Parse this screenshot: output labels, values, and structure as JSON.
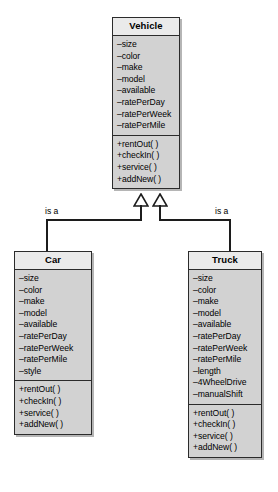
{
  "diagram": {
    "type": "uml-class-diagram",
    "background_color": "#ffffff",
    "box_fill_color": "#d2d2d2",
    "box_header_color": "#eaeaea",
    "line_color": "#1c1c1c"
  },
  "classes": {
    "vehicle": {
      "name": "Vehicle",
      "attributes": [
        "–size",
        "–color",
        "–make",
        "–model",
        "–available",
        "–ratePerDay",
        "–ratePerWeek",
        "–ratePerMile"
      ],
      "methods": [
        "+rentOut( )",
        "+checkIn( )",
        "+service( )",
        "+addNew( )"
      ]
    },
    "car": {
      "name": "Car",
      "attributes": [
        "–size",
        "–color",
        "–make",
        "–model",
        "–available",
        "–ratePerDay",
        "–ratePerWeek",
        "–ratePerMile",
        "–style"
      ],
      "methods": [
        "+rentOut( )",
        "+checkIn( )",
        "+service( )",
        "+addNew( )"
      ]
    },
    "truck": {
      "name": "Truck",
      "attributes": [
        "–size",
        "–color",
        "–make",
        "–model",
        "–available",
        "–ratePerDay",
        "–ratePerWeek",
        "–ratePerMile",
        "–length",
        "–4WheelDrive",
        "–manualShift"
      ],
      "methods": [
        "+rentOut( )",
        "+checkIn( )",
        "+service( )",
        "+addNew( )"
      ]
    }
  },
  "relationships": [
    {
      "id": "car-is-a-vehicle",
      "label": "is a",
      "from": "Car",
      "to": "Vehicle",
      "kind": "generalization"
    },
    {
      "id": "truck-is-a-vehicle",
      "label": "is a",
      "from": "Truck",
      "to": "Vehicle",
      "kind": "generalization"
    }
  ]
}
